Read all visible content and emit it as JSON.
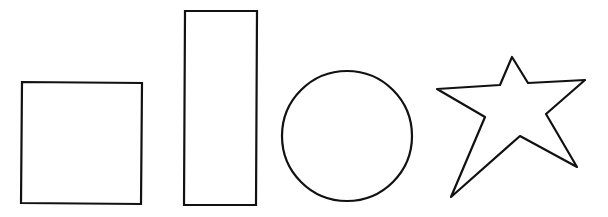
{
  "canvas": {
    "width": 608,
    "height": 217,
    "background": "#ffffff",
    "stroke_color": "#111111",
    "stroke_width": 2.2
  },
  "shapes": [
    {
      "id": "square",
      "type": "polygon",
      "label": "square",
      "points": "22,82 142,83 141,204 21,203"
    },
    {
      "id": "tall-rectangle",
      "type": "polygon",
      "label": "rectangle",
      "points": "185,11 257,11 256,205 184,205"
    },
    {
      "id": "circle",
      "type": "circle",
      "label": "circle",
      "cx": 347,
      "cy": 136,
      "r": 65
    },
    {
      "id": "star",
      "type": "polygon",
      "label": "five-pointed star",
      "points": "512,57 528,83 585,80 546,114 577,167 520,136 451,197 485,117 437,89 500,85"
    }
  ]
}
